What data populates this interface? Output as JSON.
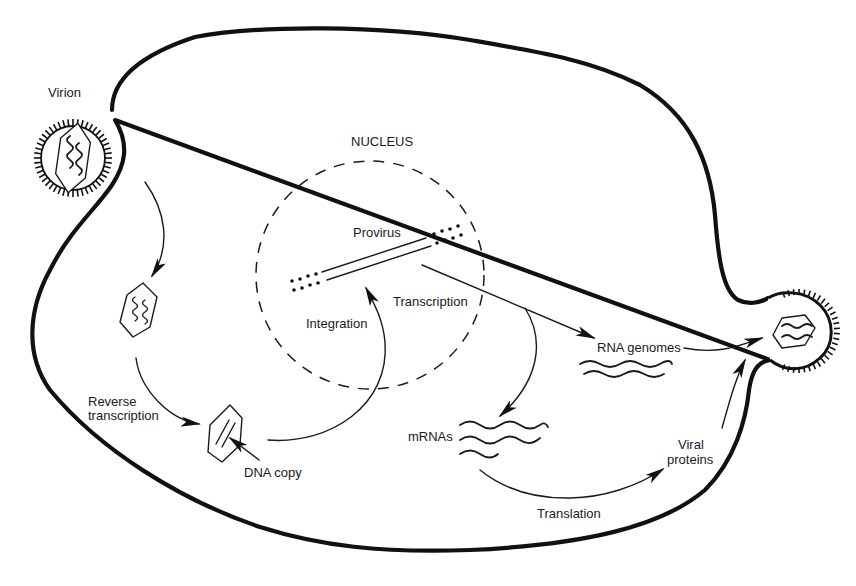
{
  "diagram": {
    "type": "retrovirus-life-cycle",
    "labels": {
      "virion": "Virion",
      "nucleus": "NUCLEUS",
      "provirus": "Provirus",
      "integration": "Integration",
      "transcription": "Transcription",
      "reverse_transcription_line1": "Reverse",
      "reverse_transcription_line2": "transcription",
      "dna_copy": "DNA copy",
      "rna_genomes": "RNA genomes",
      "mrnas": "mRNAs",
      "viral_proteins_line1": "Viral",
      "viral_proteins_line2": "proteins",
      "translation": "Translation"
    },
    "nodes": [
      {
        "id": "virion",
        "label": "Virion"
      },
      {
        "id": "uncoated-capsid",
        "label": ""
      },
      {
        "id": "dna-copy",
        "label": "DNA copy"
      },
      {
        "id": "provirus",
        "label": "Provirus"
      },
      {
        "id": "rna-genomes",
        "label": "RNA genomes"
      },
      {
        "id": "mrnas",
        "label": "mRNAs"
      },
      {
        "id": "viral-proteins",
        "label": "Viral proteins"
      },
      {
        "id": "budding-virion",
        "label": ""
      }
    ],
    "edges": [
      {
        "from": "virion",
        "to": "uncoated-capsid",
        "label": ""
      },
      {
        "from": "uncoated-capsid",
        "to": "dna-copy",
        "label": "Reverse transcription"
      },
      {
        "from": "dna-copy",
        "to": "provirus",
        "label": "Integration"
      },
      {
        "from": "provirus",
        "to": "rna-genomes",
        "label": "Transcription"
      },
      {
        "from": "provirus",
        "to": "mrnas",
        "label": ""
      },
      {
        "from": "mrnas",
        "to": "viral-proteins",
        "label": "Translation"
      },
      {
        "from": "rna-genomes",
        "to": "budding-virion",
        "label": ""
      },
      {
        "from": "viral-proteins",
        "to": "budding-virion",
        "label": ""
      }
    ],
    "colors": {
      "ink": "#111111",
      "background": "#ffffff"
    }
  }
}
